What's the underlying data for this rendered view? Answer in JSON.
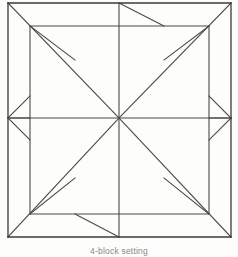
{
  "figure": {
    "caption": "4-block setting",
    "kind": "line-drawing"
  },
  "style": {
    "background_color": "#fdfdfc",
    "line_color": "#4a4a48",
    "line_color_dark": "#3a3a38",
    "stroke_width": 1.1,
    "frame_stroke_width": 1.3
  },
  "geometry": {
    "note": "Square frame subdivided into four mirrored quadrant units meeting at the center.",
    "frame": {
      "left": 8,
      "top": 3,
      "right": 231,
      "bottom": 237
    },
    "inner_square": {
      "left": 30,
      "top": 26,
      "right": 209,
      "bottom": 214
    },
    "center": {
      "x": 119,
      "y": 118
    },
    "mid_top": {
      "x": 119,
      "y": 3
    },
    "mid_bottom": {
      "x": 119,
      "y": 237
    },
    "mid_left": {
      "x": 8,
      "y": 118
    },
    "mid_right": {
      "x": 231,
      "y": 118
    }
  },
  "chart_data": {
    "type": "diagram",
    "title": "4-block setting",
    "shape_count": 4,
    "symmetry": "4-fold rotational",
    "segments": [
      {
        "name": "frame-top",
        "x1": 8,
        "y1": 3,
        "x2": 231,
        "y2": 3
      },
      {
        "name": "frame-right",
        "x1": 231,
        "y1": 3,
        "x2": 231,
        "y2": 237
      },
      {
        "name": "frame-bottom",
        "x1": 231,
        "y1": 237,
        "x2": 8,
        "y2": 237
      },
      {
        "name": "frame-left",
        "x1": 8,
        "y1": 237,
        "x2": 8,
        "y2": 3
      },
      {
        "name": "inner-top",
        "x1": 30,
        "y1": 26,
        "x2": 209,
        "y2": 26
      },
      {
        "name": "inner-right",
        "x1": 209,
        "y1": 26,
        "x2": 209,
        "y2": 214
      },
      {
        "name": "inner-bottom",
        "x1": 209,
        "y1": 214,
        "x2": 30,
        "y2": 214
      },
      {
        "name": "inner-left",
        "x1": 30,
        "y1": 214,
        "x2": 30,
        "y2": 26
      },
      {
        "name": "diag-tl-center",
        "x1": 8,
        "y1": 3,
        "x2": 119,
        "y2": 118
      },
      {
        "name": "diag-tr-center",
        "x1": 231,
        "y1": 3,
        "x2": 119,
        "y2": 118
      },
      {
        "name": "diag-bl-center",
        "x1": 8,
        "y1": 237,
        "x2": 119,
        "y2": 118
      },
      {
        "name": "diag-br-center",
        "x1": 231,
        "y1": 237,
        "x2": 119,
        "y2": 118
      },
      {
        "name": "spoke-center-top",
        "x1": 119,
        "y1": 118,
        "x2": 119,
        "y2": 3
      },
      {
        "name": "spoke-center-bottom",
        "x1": 119,
        "y1": 118,
        "x2": 119,
        "y2": 237
      },
      {
        "name": "spoke-center-left",
        "x1": 119,
        "y1": 118,
        "x2": 8,
        "y2": 118
      },
      {
        "name": "spoke-center-right",
        "x1": 119,
        "y1": 118,
        "x2": 231,
        "y2": 118
      },
      {
        "name": "tl-short-diag",
        "x1": 30,
        "y1": 26,
        "x2": 75,
        "y2": 60
      },
      {
        "name": "tl-notch-diag",
        "x1": 8,
        "y1": 118,
        "x2": 30,
        "y2": 96
      },
      {
        "name": "tr-short-diag",
        "x1": 209,
        "y1": 26,
        "x2": 164,
        "y2": 60
      },
      {
        "name": "tr-notch-diag",
        "x1": 231,
        "y1": 118,
        "x2": 209,
        "y2": 96
      },
      {
        "name": "bl-short-diag",
        "x1": 30,
        "y1": 214,
        "x2": 75,
        "y2": 178
      },
      {
        "name": "bl-notch-diag",
        "x1": 8,
        "y1": 118,
        "x2": 30,
        "y2": 140
      },
      {
        "name": "br-short-diag",
        "x1": 209,
        "y1": 214,
        "x2": 164,
        "y2": 178
      },
      {
        "name": "br-notch-diag",
        "x1": 231,
        "y1": 118,
        "x2": 209,
        "y2": 140
      },
      {
        "name": "top-mid-right-diag",
        "x1": 119,
        "y1": 3,
        "x2": 164,
        "y2": 26
      },
      {
        "name": "bottom-mid-left-diag",
        "x1": 119,
        "y1": 237,
        "x2": 75,
        "y2": 214
      },
      {
        "name": "left-mid-stub",
        "x1": 8,
        "y1": 118,
        "x2": 30,
        "y2": 118
      },
      {
        "name": "right-mid-stub",
        "x1": 231,
        "y1": 118,
        "x2": 209,
        "y2": 118
      }
    ]
  }
}
